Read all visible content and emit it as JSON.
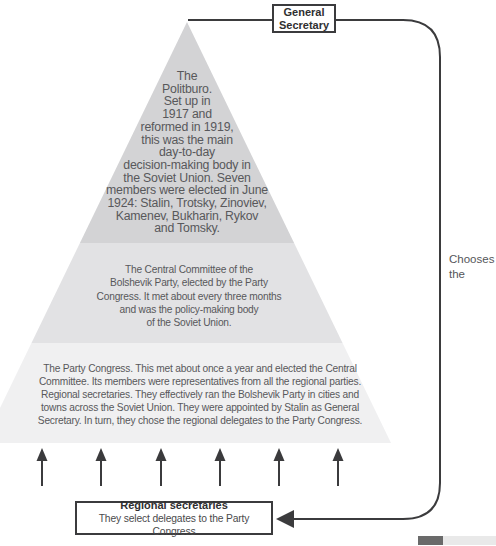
{
  "general_secretary_box": {
    "label": "General\nSecretary"
  },
  "chooses_label": "Chooses\nthe",
  "pyramid": {
    "tiers": [
      {
        "name": "Politburo",
        "fill": "#d3d3d5",
        "text": "The\nPolitburo.\nSet up in\n1917 and\nreformed in 1919,\nthis was the main\nday-to-day\ndecision-making body in\nthe Soviet Union. Seven\nmembers were elected in June\n1924: Stalin, Trotsky, Zinoviev,\nKamenev, Bukharin, Rykov\nand Tomsky."
      },
      {
        "name": "Central Committee",
        "fill": "#e2e2e4",
        "text": "The Central Committee of the\nBolshevik Party, elected by the Party\nCongress. It met about every three months\nand was the policy-making body\nof the Soviet Union."
      },
      {
        "name": "Party Congress",
        "fill": "#f0f0f1",
        "text": "The Party Congress. This met about once a year and elected the Central\nCommittee. Its members were representatives from all the regional parties.\nRegional secretaries. They effectively ran the Bolshevik Party in cities and\ntowns across the Soviet Union. They were appointed by Stalin as General\nSecretary. In turn, they chose the regional delegates to the Party Congress."
      }
    ]
  },
  "regional_secretaries_box": {
    "title": "Regional secretaries",
    "subtitle": "They select delegates to the Party Congress"
  },
  "icons": {
    "up_arrow": "↑",
    "left_arrowhead": "◄"
  },
  "colors": {
    "tier_top": "#d3d3d5",
    "tier_middle": "#e2e2e4",
    "tier_bottom": "#f0f0f1",
    "connector_line": "#3b3b3d",
    "tier_text": "#58585b",
    "box_border": "#3b3b3d",
    "bar_dark": "#6a6a6a",
    "bar_light": "#e9e9e9"
  }
}
